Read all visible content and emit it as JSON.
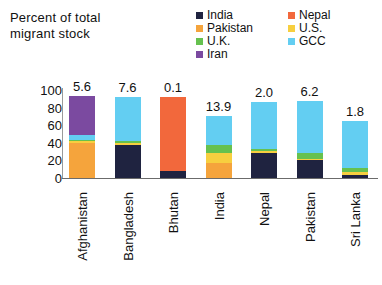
{
  "axis_title": {
    "line1": "Percent of total",
    "line2": "migrant stock"
  },
  "legend": {
    "items": [
      {
        "label": "India",
        "color": "#1f2340",
        "icon": "legend-swatch-icon"
      },
      {
        "label": "Nepal",
        "color": "#f2683c",
        "icon": "legend-swatch-icon"
      },
      {
        "label": "Pakistan",
        "color": "#f5a43c",
        "icon": "legend-swatch-icon"
      },
      {
        "label": "U.S.",
        "color": "#f7cf3f",
        "icon": "legend-swatch-icon"
      },
      {
        "label": "U.K.",
        "color": "#66c14f",
        "icon": "legend-swatch-icon"
      },
      {
        "label": "GCC",
        "color": "#63cef2",
        "icon": "legend-swatch-icon"
      },
      {
        "label": "Iran",
        "color": "#7b4aa0",
        "icon": "legend-swatch-icon"
      }
    ],
    "order": [
      0,
      1,
      2,
      3,
      4,
      5,
      6
    ]
  },
  "chart_data": {
    "type": "bar",
    "subtype": "stacked-column",
    "title": "",
    "subtitle": "",
    "xlabel": "",
    "ylabel": "Percent of total migrant stock",
    "ylim": [
      0,
      100
    ],
    "yticks": [
      100,
      80,
      60,
      40,
      20,
      0
    ],
    "grid": false,
    "legend_position": "top-right",
    "categories": [
      "Afghanistan",
      "Bangladesh",
      "Bhutan",
      "India",
      "Nepal",
      "Pakistan",
      "Sri Lanka"
    ],
    "bar_labels": [
      "5.6",
      "7.6",
      "0.1",
      "13.9",
      "2.0",
      "6.2",
      "1.8"
    ],
    "bar_label_note": "Value printed above each column",
    "series": [
      {
        "name": "India",
        "color": "#1f2340",
        "values": [
          0.0,
          38.0,
          8.0,
          0.0,
          28.0,
          20.0,
          3.0
        ]
      },
      {
        "name": "Nepal",
        "color": "#f2683c",
        "values": [
          0.0,
          0.0,
          84.0,
          0.0,
          0.0,
          0.0,
          0.0
        ]
      },
      {
        "name": "Pakistan",
        "color": "#f5a43c",
        "values": [
          40.0,
          0.0,
          0.0,
          17.0,
          0.0,
          0.0,
          0.0
        ]
      },
      {
        "name": "U.S.",
        "color": "#f7cf3f",
        "values": [
          2.0,
          2.0,
          0.0,
          12.0,
          3.0,
          2.0,
          4.0
        ]
      },
      {
        "name": "U.K.",
        "color": "#66c14f",
        "values": [
          1.0,
          2.0,
          0.0,
          8.0,
          2.0,
          7.0,
          4.0
        ]
      },
      {
        "name": "GCC",
        "color": "#63cef2",
        "values": [
          6.0,
          50.0,
          0.0,
          33.0,
          53.0,
          58.0,
          54.0
        ]
      },
      {
        "name": "Iran",
        "color": "#7b4aa0",
        "values": [
          44.0,
          0.0,
          0.0,
          0.0,
          0.0,
          0.0,
          0.0
        ]
      }
    ],
    "totals": [
      93.0,
      92.0,
      92.0,
      70.0,
      86.0,
      87.0,
      65.0
    ]
  }
}
